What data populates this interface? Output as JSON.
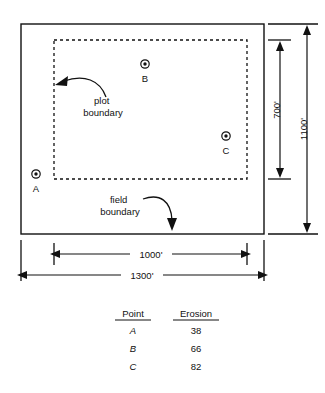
{
  "figure": {
    "field": {
      "label": "field boundary",
      "width_label": "1300'",
      "height_label": "1100'"
    },
    "plot": {
      "label": "plot boundary",
      "width_label": "1000'",
      "height_label": "700'"
    },
    "points": [
      {
        "id": "A",
        "label": "A",
        "marker": "bullseye-marker"
      },
      {
        "id": "B",
        "label": "B",
        "marker": "bullseye-marker"
      },
      {
        "id": "C",
        "label": "C",
        "marker": "bullseye-marker"
      }
    ]
  },
  "table": {
    "headers": [
      "Point",
      "Erosion"
    ],
    "rows": [
      {
        "point": "A",
        "erosion": "38"
      },
      {
        "point": "B",
        "erosion": "66"
      },
      {
        "point": "C",
        "erosion": "82"
      }
    ]
  },
  "colors": {
    "ink": "#111111",
    "background": "#ffffff"
  }
}
